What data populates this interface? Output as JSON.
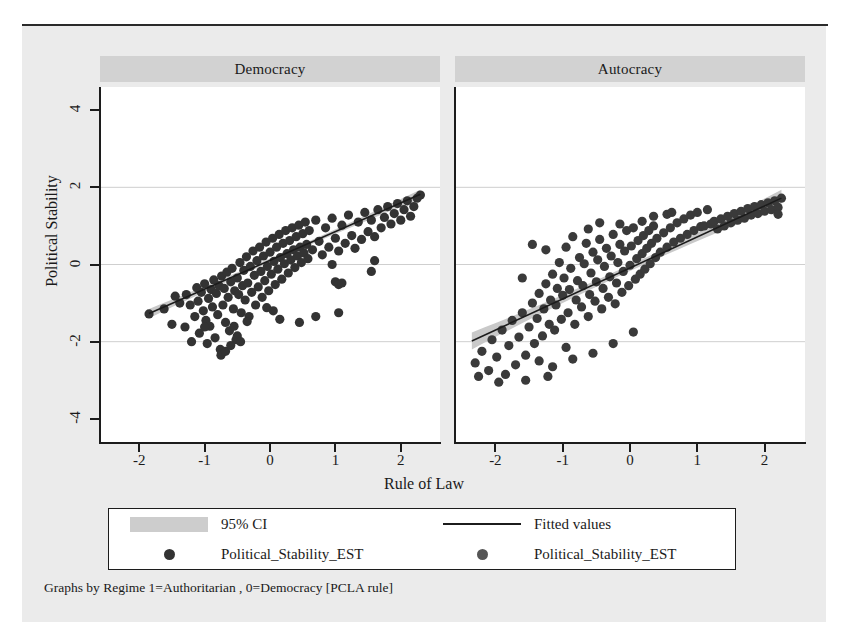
{
  "figure": {
    "caption": "Graphs by Regime 1=Authoritarian , 0=Democracy [PCLA rule]",
    "xlabel": "Rule of Law",
    "ylabel": "Political Stability"
  },
  "legend": {
    "entries": [
      {
        "label": "95% CI",
        "key": "band-swatch"
      },
      {
        "label": "Fitted values",
        "key": "line-swatch"
      },
      {
        "label": "Political_Stability_EST",
        "key": "dot-swatch-dark"
      },
      {
        "label": "Political_Stability_EST",
        "key": "dot-swatch-gray"
      }
    ]
  },
  "colors": {
    "marker_dark": "#333333",
    "marker_gray": "#555555",
    "ci_band": "#c9c9c9",
    "fit_line": "#1c1c1c",
    "grid": "#cfcfcf",
    "panel_header": "#d2d2d2",
    "paper": "#ebebeb"
  },
  "chart_data": {
    "type": "scatter",
    "title": "",
    "xlabel": "Rule of Law",
    "ylabel": "Political Stability",
    "xlim": [
      -2.6,
      2.6
    ],
    "ylim": [
      -4.6,
      4.6
    ],
    "xticks": [
      -2,
      -1,
      0,
      1,
      2
    ],
    "yticks": [
      4,
      2,
      0,
      -2,
      -4
    ],
    "grid": "horizontal",
    "legend_position": "bottom",
    "panels": [
      {
        "name": "Democracy",
        "marker_color": "#333333",
        "fit_line": {
          "x": [
            -1.85,
            2.3
          ],
          "y": [
            -1.27,
            1.82
          ]
        },
        "ci_band_halfwidth": [
          0.12,
          0.05,
          0.05,
          0.1
        ],
        "points": [
          [
            -1.85,
            -1.28
          ],
          [
            -1.62,
            -1.15
          ],
          [
            -1.5,
            -1.55
          ],
          [
            -1.45,
            -0.82
          ],
          [
            -1.38,
            -1.0
          ],
          [
            -1.3,
            -1.62
          ],
          [
            -1.28,
            -0.78
          ],
          [
            -1.22,
            -1.05
          ],
          [
            -1.2,
            -2.0
          ],
          [
            -1.15,
            -1.35
          ],
          [
            -1.12,
            -0.6
          ],
          [
            -1.1,
            -0.95
          ],
          [
            -1.08,
            -1.78
          ],
          [
            -1.05,
            -0.72
          ],
          [
            -1.02,
            -1.2
          ],
          [
            -1.0,
            -0.5
          ],
          [
            -0.98,
            -1.45
          ],
          [
            -0.96,
            -2.05
          ],
          [
            -0.94,
            -0.88
          ],
          [
            -0.92,
            -1.6
          ],
          [
            -0.9,
            -0.65
          ],
          [
            -0.88,
            -1.1
          ],
          [
            -0.86,
            -0.4
          ],
          [
            -0.84,
            -1.9
          ],
          [
            -0.82,
            -0.75
          ],
          [
            -0.8,
            -1.3
          ],
          [
            -0.78,
            -0.55
          ],
          [
            -0.76,
            -2.2
          ],
          [
            -0.74,
            -0.3
          ],
          [
            -0.72,
            -1.05
          ],
          [
            -0.7,
            -0.62
          ],
          [
            -0.68,
            -1.5
          ],
          [
            -0.66,
            -0.2
          ],
          [
            -0.64,
            -0.85
          ],
          [
            -0.62,
            -1.72
          ],
          [
            -0.6,
            -0.45
          ],
          [
            -0.58,
            -0.1
          ],
          [
            -0.56,
            -1.15
          ],
          [
            -0.54,
            -0.68
          ],
          [
            -0.52,
            -1.95
          ],
          [
            -0.5,
            -0.35
          ],
          [
            -0.48,
            -0.78
          ],
          [
            -0.46,
            0.05
          ],
          [
            -0.44,
            -1.25
          ],
          [
            -0.42,
            -0.55
          ],
          [
            -0.4,
            -0.15
          ],
          [
            -0.38,
            -0.92
          ],
          [
            -0.36,
            0.2
          ],
          [
            -0.34,
            -0.48
          ],
          [
            -0.32,
            -1.35
          ],
          [
            -0.3,
            -0.05
          ],
          [
            -0.28,
            -0.72
          ],
          [
            -0.26,
            0.35
          ],
          [
            -0.24,
            -0.28
          ],
          [
            -0.22,
            -1.05
          ],
          [
            -0.2,
            0.1
          ],
          [
            -0.18,
            -0.58
          ],
          [
            -0.16,
            0.45
          ],
          [
            -0.14,
            -0.18
          ],
          [
            -0.12,
            -0.85
          ],
          [
            -0.1,
            0.22
          ],
          [
            -0.08,
            -0.42
          ],
          [
            -0.06,
            0.58
          ],
          [
            -0.04,
            -0.05
          ],
          [
            -0.02,
            -0.68
          ],
          [
            0.0,
            0.32
          ],
          [
            0.02,
            -0.25
          ],
          [
            0.04,
            0.68
          ],
          [
            0.06,
            0.08
          ],
          [
            0.08,
            -0.52
          ],
          [
            0.1,
            0.45
          ],
          [
            0.12,
            -0.12
          ],
          [
            0.14,
            0.78
          ],
          [
            0.16,
            0.18
          ],
          [
            0.18,
            -0.38
          ],
          [
            0.2,
            0.55
          ],
          [
            0.22,
            0.02
          ],
          [
            0.24,
            0.88
          ],
          [
            0.26,
            0.28
          ],
          [
            0.28,
            -0.22
          ],
          [
            0.3,
            0.62
          ],
          [
            0.32,
            0.12
          ],
          [
            0.34,
            0.95
          ],
          [
            0.36,
            0.38
          ],
          [
            0.38,
            -0.08
          ],
          [
            0.4,
            0.72
          ],
          [
            0.42,
            0.22
          ],
          [
            0.44,
            1.02
          ],
          [
            0.46,
            0.45
          ],
          [
            0.48,
            0.05
          ],
          [
            0.5,
            0.8
          ],
          [
            0.52,
            0.3
          ],
          [
            0.54,
            1.1
          ],
          [
            0.56,
            0.52
          ],
          [
            0.58,
            0.15
          ],
          [
            0.6,
            0.88
          ],
          [
            0.65,
            0.38
          ],
          [
            0.7,
            1.15
          ],
          [
            0.75,
            0.6
          ],
          [
            0.8,
            0.25
          ],
          [
            0.85,
            0.95
          ],
          [
            0.9,
            0.45
          ],
          [
            0.95,
            1.2
          ],
          [
            1.0,
            0.68
          ],
          [
            1.05,
            0.35
          ],
          [
            1.1,
            1.02
          ],
          [
            1.15,
            0.55
          ],
          [
            1.2,
            1.28
          ],
          [
            1.25,
            0.75
          ],
          [
            1.3,
            0.42
          ],
          [
            1.35,
            1.1
          ],
          [
            1.4,
            0.65
          ],
          [
            1.45,
            1.35
          ],
          [
            1.5,
            0.85
          ],
          [
            1.55,
            1.15
          ],
          [
            1.6,
            0.72
          ],
          [
            1.65,
            1.42
          ],
          [
            1.7,
            0.95
          ],
          [
            1.75,
            1.22
          ],
          [
            1.8,
            1.5
          ],
          [
            1.85,
            1.05
          ],
          [
            1.9,
            1.32
          ],
          [
            1.95,
            1.58
          ],
          [
            2.0,
            1.15
          ],
          [
            2.05,
            1.42
          ],
          [
            2.1,
            1.65
          ],
          [
            2.15,
            1.25
          ],
          [
            2.2,
            1.5
          ],
          [
            2.25,
            1.72
          ],
          [
            2.3,
            1.8
          ],
          [
            -0.55,
            -1.6
          ],
          [
            -0.35,
            -1.48
          ],
          [
            0.15,
            -1.42
          ],
          [
            0.45,
            -1.5
          ],
          [
            0.7,
            -1.35
          ],
          [
            1.05,
            -1.25
          ],
          [
            1.0,
            -0.45
          ],
          [
            1.05,
            -0.52
          ],
          [
            1.1,
            -0.48
          ],
          [
            1.6,
            0.1
          ],
          [
            1.55,
            -0.18
          ],
          [
            0.95,
            0.0
          ],
          [
            -0.05,
            -1.12
          ],
          [
            0.05,
            -1.2
          ],
          [
            -0.75,
            -2.35
          ],
          [
            -0.68,
            -2.25
          ],
          [
            -0.6,
            -2.1
          ],
          [
            -0.5,
            -1.85
          ],
          [
            -0.45,
            -2.0
          ],
          [
            -1.0,
            -1.62
          ]
        ]
      },
      {
        "name": "Autocracy",
        "marker_color": "#3a3a3a",
        "fit_line": {
          "x": [
            -2.35,
            2.25
          ],
          "y": [
            -1.98,
            1.72
          ]
        },
        "ci_band_halfwidth": [
          0.22,
          0.08,
          0.08,
          0.2
        ],
        "points": [
          [
            -2.3,
            -2.55
          ],
          [
            -2.2,
            -2.25
          ],
          [
            -2.1,
            -2.75
          ],
          [
            -2.05,
            -1.95
          ],
          [
            -1.98,
            -2.4
          ],
          [
            -1.9,
            -1.7
          ],
          [
            -1.85,
            -2.85
          ],
          [
            -1.8,
            -2.1
          ],
          [
            -1.75,
            -1.45
          ],
          [
            -1.7,
            -2.6
          ],
          [
            -1.65,
            -1.88
          ],
          [
            -1.6,
            -1.25
          ],
          [
            -1.55,
            -2.35
          ],
          [
            -1.5,
            -1.62
          ],
          [
            -1.45,
            -1.0
          ],
          [
            -1.42,
            -2.05
          ],
          [
            -1.38,
            -1.4
          ],
          [
            -1.35,
            -0.75
          ],
          [
            -1.3,
            -1.85
          ],
          [
            -1.28,
            -1.15
          ],
          [
            -1.25,
            -0.5
          ],
          [
            -1.22,
            -2.9
          ],
          [
            -1.2,
            -1.55
          ],
          [
            -1.18,
            -0.92
          ],
          [
            -1.15,
            -0.25
          ],
          [
            -1.12,
            -1.7
          ],
          [
            -1.1,
            -1.05
          ],
          [
            -1.08,
            -0.62
          ],
          [
            -1.05,
            0.05
          ],
          [
            -1.02,
            -1.42
          ],
          [
            -1.0,
            -0.8
          ],
          [
            -0.98,
            -0.35
          ],
          [
            -0.95,
            0.45
          ],
          [
            -0.92,
            -1.25
          ],
          [
            -0.9,
            -0.65
          ],
          [
            -0.88,
            -0.1
          ],
          [
            -0.85,
            0.72
          ],
          [
            -0.82,
            -1.55
          ],
          [
            -0.8,
            -0.92
          ],
          [
            -0.78,
            -0.42
          ],
          [
            -0.75,
            0.18
          ],
          [
            -0.72,
            -1.1
          ],
          [
            -0.7,
            -0.55
          ],
          [
            -0.68,
            0.02
          ],
          [
            -0.65,
            0.55
          ],
          [
            -0.62,
            -1.35
          ],
          [
            -0.6,
            -0.78
          ],
          [
            -0.58,
            -0.22
          ],
          [
            -0.55,
            0.32
          ],
          [
            -0.52,
            -0.95
          ],
          [
            -0.5,
            -0.45
          ],
          [
            -0.48,
            0.12
          ],
          [
            -0.45,
            0.65
          ],
          [
            -0.42,
            -1.15
          ],
          [
            -0.4,
            -0.62
          ],
          [
            -0.38,
            -0.05
          ],
          [
            -0.35,
            0.42
          ],
          [
            -0.32,
            -0.85
          ],
          [
            -0.3,
            -0.32
          ],
          [
            -0.28,
            0.22
          ],
          [
            -0.25,
            0.78
          ],
          [
            -0.22,
            -1.02
          ],
          [
            -0.2,
            -0.48
          ],
          [
            -0.18,
            0.05
          ],
          [
            -0.15,
            0.52
          ],
          [
            -0.12,
            -0.72
          ],
          [
            -0.1,
            -0.18
          ],
          [
            -0.08,
            0.35
          ],
          [
            -0.05,
            0.88
          ],
          [
            -0.02,
            -0.55
          ],
          [
            0.0,
            -0.02
          ],
          [
            0.02,
            0.48
          ],
          [
            0.05,
            0.95
          ],
          [
            0.08,
            -0.38
          ],
          [
            0.1,
            0.15
          ],
          [
            0.12,
            0.62
          ],
          [
            0.15,
            -0.25
          ],
          [
            0.18,
            0.28
          ],
          [
            0.2,
            0.75
          ],
          [
            0.22,
            -0.12
          ],
          [
            0.25,
            0.42
          ],
          [
            0.28,
            0.88
          ],
          [
            0.3,
            0.02
          ],
          [
            0.32,
            0.55
          ],
          [
            0.35,
            1.0
          ],
          [
            0.38,
            0.18
          ],
          [
            0.4,
            0.68
          ],
          [
            0.45,
            0.32
          ],
          [
            0.5,
            0.82
          ],
          [
            0.55,
            0.45
          ],
          [
            0.6,
            0.95
          ],
          [
            0.65,
            0.58
          ],
          [
            0.7,
            1.08
          ],
          [
            0.75,
            0.68
          ],
          [
            0.8,
            1.18
          ],
          [
            0.85,
            0.78
          ],
          [
            0.9,
            1.28
          ],
          [
            0.95,
            0.88
          ],
          [
            1.0,
            1.35
          ],
          [
            1.05,
            0.98
          ],
          [
            1.1,
            1.0
          ],
          [
            1.15,
            1.42
          ],
          [
            1.2,
            1.05
          ],
          [
            1.25,
            1.12
          ],
          [
            1.3,
            0.92
          ],
          [
            1.35,
            1.18
          ],
          [
            1.4,
            1.0
          ],
          [
            1.45,
            1.25
          ],
          [
            1.5,
            1.08
          ],
          [
            1.55,
            1.32
          ],
          [
            1.6,
            1.15
          ],
          [
            1.65,
            1.38
          ],
          [
            1.7,
            1.2
          ],
          [
            1.75,
            1.45
          ],
          [
            1.8,
            1.28
          ],
          [
            1.85,
            1.5
          ],
          [
            1.9,
            1.32
          ],
          [
            1.95,
            1.55
          ],
          [
            2.0,
            1.38
          ],
          [
            2.05,
            1.6
          ],
          [
            2.1,
            1.42
          ],
          [
            2.15,
            1.65
          ],
          [
            2.2,
            1.48
          ],
          [
            2.25,
            1.72
          ],
          [
            2.2,
            1.3
          ],
          [
            -1.45,
            0.52
          ],
          [
            -1.25,
            0.38
          ],
          [
            -1.6,
            -0.35
          ],
          [
            -0.45,
            1.08
          ],
          [
            -0.15,
            1.05
          ],
          [
            -0.62,
            0.92
          ],
          [
            0.18,
            1.12
          ],
          [
            0.35,
            1.25
          ],
          [
            0.55,
            1.3
          ],
          [
            0.62,
            1.35
          ],
          [
            -2.25,
            -2.9
          ],
          [
            -1.95,
            -3.05
          ],
          [
            -1.55,
            -3.0
          ],
          [
            -1.15,
            -2.65
          ],
          [
            -0.85,
            -2.45
          ],
          [
            -0.55,
            -2.3
          ],
          [
            -0.25,
            -2.05
          ],
          [
            0.05,
            -1.75
          ],
          [
            -1.35,
            -2.5
          ],
          [
            -0.95,
            -2.15
          ]
        ]
      }
    ]
  }
}
